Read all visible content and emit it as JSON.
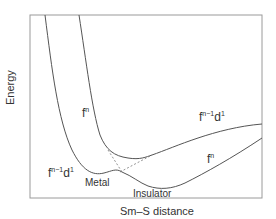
{
  "diagram": {
    "title": "",
    "axes": {
      "x_label": "Sm–S distance",
      "y_label": "Energy"
    },
    "curves": [
      {
        "id": "metal-fn",
        "label_base": "f",
        "label_sup": "n",
        "description": "steep left curve, f^n state (metal side)"
      },
      {
        "id": "metal-fn1d1",
        "label_base": "f",
        "label_sup": "n−1",
        "label_tail": "d",
        "label_tail_sup": "1",
        "description": "left curve, f^(n-1)d^1 state with Metal minimum"
      },
      {
        "id": "insulator-fn",
        "label_base": "f",
        "label_sup": "n",
        "description": "right curve, f^n state with Insulator minimum"
      },
      {
        "id": "insulator-fn1d1",
        "label_base": "f",
        "label_sup": "n−1",
        "label_tail": "d",
        "label_tail_sup": "1",
        "description": "upper right curve, f^(n-1)d^1 state"
      }
    ],
    "labels": {
      "fn_left_base": "f",
      "fn_left_sup": "n",
      "fn1d1_left_base": "f",
      "fn1d1_left_sup": "n−1",
      "fn1d1_left_d": "d",
      "fn1d1_left_dsup": "1",
      "fn1d1_right_base": "f",
      "fn1d1_right_sup": "n−1",
      "fn1d1_right_d": "d",
      "fn1d1_right_dsup": "1",
      "fn_right_base": "f",
      "fn_right_sup": "n",
      "metal": "Metal",
      "insulator": "Insulator"
    },
    "colors": {
      "frame": "#9a9a9a",
      "curve": "#555555",
      "dashed": "#777777",
      "text": "#333333"
    }
  }
}
